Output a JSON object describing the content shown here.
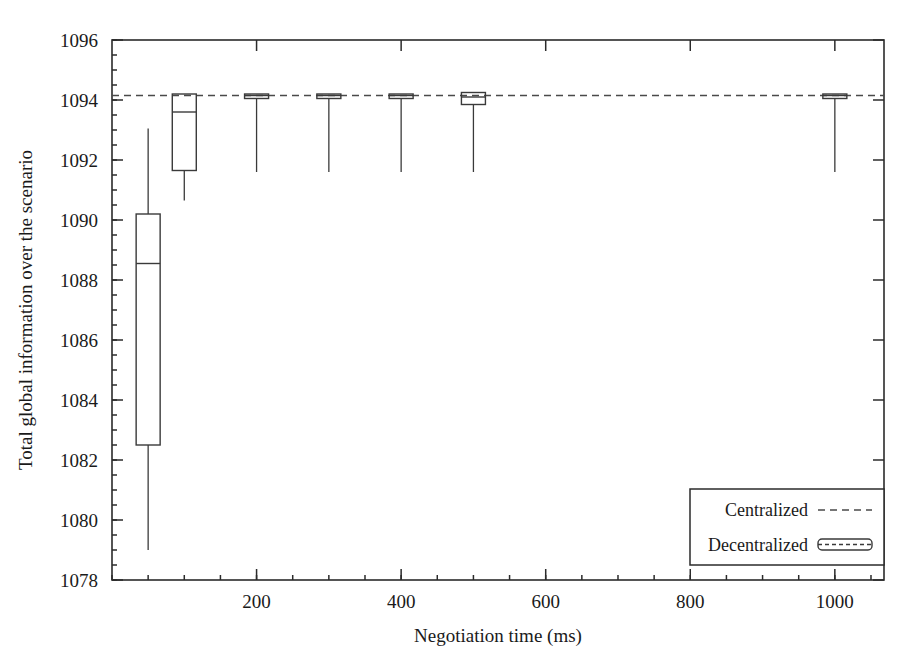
{
  "chart_data": {
    "type": "box",
    "title": "",
    "xlabel": "Negotiation time (ms)",
    "ylabel": "Total global information over the scenario",
    "xlim": [
      0,
      1068
    ],
    "ylim": [
      1078,
      1096
    ],
    "grid": false,
    "xticks": [
      200,
      400,
      600,
      800,
      1000
    ],
    "xtick_labels": [
      "200",
      "400",
      "600",
      "800",
      "1000"
    ],
    "yticks": [
      1078,
      1080,
      1082,
      1084,
      1086,
      1088,
      1090,
      1092,
      1094,
      1096
    ],
    "ytick_labels": [
      "1078",
      "1080",
      "1082",
      "1084",
      "1086",
      "1088",
      "1090",
      "1092",
      "1094",
      "1096"
    ],
    "y_minor_step": 0.5,
    "reference_line": {
      "name": "Centralized",
      "value": 1094.15,
      "style": "dashed"
    },
    "series_name": "Decentralized",
    "boxes": [
      {
        "x": 50,
        "whisker_low": 1079.0,
        "q1": 1082.5,
        "median": 1088.55,
        "q3": 1090.2,
        "whisker_high": 1093.05
      },
      {
        "x": 100,
        "whisker_low": 1090.65,
        "q1": 1091.65,
        "median": 1093.6,
        "q3": 1094.2,
        "whisker_high": 1094.2
      },
      {
        "x": 200,
        "whisker_low": 1091.6,
        "q1": 1094.05,
        "median": 1094.15,
        "q3": 1094.2,
        "whisker_high": 1094.2
      },
      {
        "x": 300,
        "whisker_low": 1091.6,
        "q1": 1094.05,
        "median": 1094.15,
        "q3": 1094.2,
        "whisker_high": 1094.2
      },
      {
        "x": 400,
        "whisker_low": 1091.6,
        "q1": 1094.05,
        "median": 1094.15,
        "q3": 1094.2,
        "whisker_high": 1094.2
      },
      {
        "x": 500,
        "whisker_low": 1091.6,
        "q1": 1093.85,
        "median": 1094.1,
        "q3": 1094.25,
        "whisker_high": 1094.25
      },
      {
        "x": 1000,
        "whisker_low": 1091.6,
        "q1": 1094.05,
        "median": 1094.15,
        "q3": 1094.2,
        "whisker_high": 1094.2
      }
    ],
    "legend": {
      "position": "bottom-right",
      "entries": [
        {
          "label": "Centralized",
          "marker": "dashed-line"
        },
        {
          "label": "Decentralized",
          "marker": "box"
        }
      ]
    }
  }
}
